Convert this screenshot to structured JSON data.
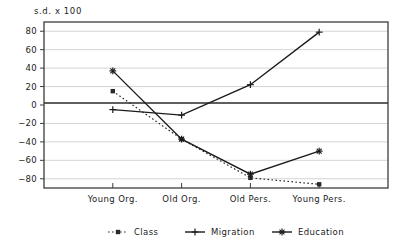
{
  "chart_data": {
    "type": "line",
    "title": "s.d. x 100",
    "xlabel": "",
    "ylabel": "",
    "ylim": [
      -90,
      90
    ],
    "yticks": [
      80,
      60,
      40,
      20,
      0,
      -20,
      -40,
      -60,
      -80
    ],
    "ytick_labels": [
      "80",
      "60",
      "40",
      "20",
      "0",
      "−20",
      "−40",
      "−60",
      "−80"
    ],
    "categories": [
      "Young Org.",
      "Old Org.",
      "Old Pers.",
      "Young Pers."
    ],
    "grid": true,
    "legend_position": "bottom",
    "series": [
      {
        "name": "Class",
        "values": [
          15,
          -37,
          -79,
          -86
        ],
        "linestyle": "dotted",
        "marker": "square",
        "color": "#2a2a2a"
      },
      {
        "name": "Migration",
        "values": [
          -5,
          -11,
          22,
          79
        ],
        "linestyle": "solid",
        "marker": "plus",
        "color": "#1b1b1b"
      },
      {
        "name": "Education",
        "values": [
          37,
          -37,
          -75,
          -50
        ],
        "linestyle": "solid",
        "marker": "asterisk",
        "color": "#1b1b1b"
      }
    ]
  },
  "legend": {
    "items": [
      {
        "label": "Class"
      },
      {
        "label": "Migration"
      },
      {
        "label": "Education"
      }
    ]
  },
  "colors": {
    "axis": "#3c3c3c",
    "grid": "#c9c9c9",
    "zero_line": "#2a2a2a",
    "text": "#1b1b1b",
    "background": "#ffffff"
  }
}
